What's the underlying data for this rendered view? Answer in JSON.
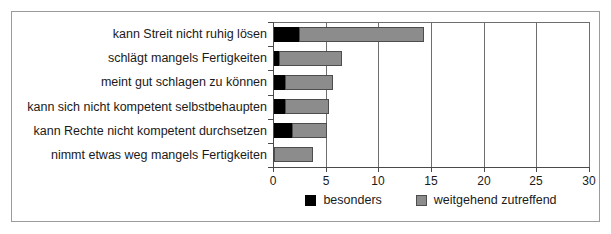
{
  "chart_data": {
    "type": "bar",
    "orientation": "horizontal",
    "stacked": true,
    "title": "",
    "xlabel": "",
    "ylabel": "",
    "xlim": [
      0,
      30
    ],
    "xticks": [
      0,
      5,
      10,
      15,
      20,
      25,
      30
    ],
    "xticklabels": [
      "0",
      "5",
      "10",
      "15",
      "20",
      "25",
      "30"
    ],
    "grid": "vertical",
    "legend_position": "bottom-center",
    "categories": [
      "kann Streit nicht ruhig lösen",
      "schlägt mangels Fertigkeiten",
      "meint gut schlagen zu können",
      "kann sich nicht kompetent selbstbehaupten",
      "kann Rechte nicht kompetent durchsetzen",
      "nimmt etwas weg mangels Fertigkeiten"
    ],
    "series": [
      {
        "name": "besonders",
        "color": "#000000",
        "values": [
          2.4,
          0.5,
          1.0,
          1.0,
          1.7,
          0.0
        ]
      },
      {
        "name": "weitgehend zutreffend",
        "color": "#8c8c8c",
        "values": [
          11.8,
          6.0,
          4.6,
          4.2,
          3.3,
          3.7
        ]
      }
    ],
    "totals": [
      14.2,
      6.5,
      5.6,
      5.2,
      5.0,
      3.7
    ]
  },
  "legend": {
    "entries": [
      {
        "label": "besonders",
        "swatch": "black-swatch-icon"
      },
      {
        "label": "weitgehend zutreffend",
        "swatch": "gray-swatch-icon"
      }
    ]
  }
}
